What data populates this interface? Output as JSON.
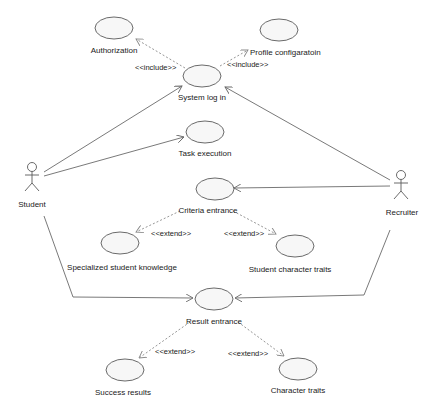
{
  "diagram": {
    "type": "uml-use-case",
    "actors": [
      {
        "id": "student",
        "label": "Student"
      },
      {
        "id": "recruiter",
        "label": "Recruiter"
      }
    ],
    "use_cases": [
      {
        "id": "authorization",
        "label": "Authorization"
      },
      {
        "id": "profile",
        "label": "Profile configaratoin"
      },
      {
        "id": "login",
        "label": "System log in"
      },
      {
        "id": "task",
        "label": "Task execution"
      },
      {
        "id": "criteria",
        "label": "Criteria entrance"
      },
      {
        "id": "knowledge",
        "label": "Specialized student knowledge"
      },
      {
        "id": "student_traits",
        "label": "Student character traits"
      },
      {
        "id": "result",
        "label": "Result entrance"
      },
      {
        "id": "success",
        "label": "Success results"
      },
      {
        "id": "char_traits",
        "label": "Character traits"
      }
    ],
    "relations": [
      {
        "from": "login",
        "to": "authorization",
        "type": "include",
        "label": "<<include>>"
      },
      {
        "from": "login",
        "to": "profile",
        "type": "include",
        "label": "<<include>>"
      },
      {
        "from": "criteria",
        "to": "knowledge",
        "type": "extend",
        "label": "<<extend>>"
      },
      {
        "from": "criteria",
        "to": "student_traits",
        "type": "extend",
        "label": "<<extend>>"
      },
      {
        "from": "result",
        "to": "success",
        "type": "extend",
        "label": "<<extend>>"
      },
      {
        "from": "result",
        "to": "char_traits",
        "type": "extend",
        "label": "<<extend>>"
      },
      {
        "from": "student",
        "to": "login",
        "type": "association"
      },
      {
        "from": "student",
        "to": "task",
        "type": "association"
      },
      {
        "from": "student",
        "to": "result",
        "type": "association"
      },
      {
        "from": "recruiter",
        "to": "login",
        "type": "association"
      },
      {
        "from": "recruiter",
        "to": "criteria",
        "type": "association"
      },
      {
        "from": "recruiter",
        "to": "result",
        "type": "association"
      }
    ]
  },
  "labels": {
    "student": "Student",
    "recruiter": "Recruiter",
    "authorization": "Authorization",
    "profile": "Profile configaratoin",
    "login": "System log in",
    "task": "Task execution",
    "criteria": "Criteria entrance",
    "knowledge": "Specialized student knowledge",
    "student_traits": "Student character traits",
    "result": "Result entrance",
    "success": "Success results",
    "char_traits": "Character traits",
    "include": "<<include>>",
    "extend": "<<extend>>"
  }
}
